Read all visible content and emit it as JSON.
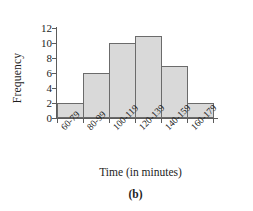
{
  "chart_data": {
    "type": "bar",
    "title": "",
    "subtitle": "",
    "caption": "(b)",
    "xlabel": "Time (in minutes)",
    "ylabel": "Frequency",
    "categories": [
      "60-79",
      "80-99",
      "100-119",
      "120-139",
      "140-159",
      "160-179"
    ],
    "values": [
      2,
      6,
      10,
      11,
      7,
      2
    ],
    "series": [
      {
        "name": "Frequency",
        "values": [
          2,
          6,
          10,
          11,
          7,
          2
        ]
      }
    ],
    "ylim": [
      0,
      12
    ],
    "yticks": [
      0,
      2,
      4,
      6,
      8,
      10,
      12
    ],
    "ytick_labels": [
      "0",
      "2",
      "4",
      "6",
      "8",
      "10",
      "12"
    ],
    "grid": false,
    "legend": false,
    "legend_position": "none",
    "bar_fill_color": "#d9d9d9",
    "bar_edge_color": "#6b6b6b",
    "axis_color": "#5c5c5c",
    "text_color": "#1d1d1d",
    "background_color": "#ffffff",
    "histogram": true,
    "bar_gap": 0
  }
}
